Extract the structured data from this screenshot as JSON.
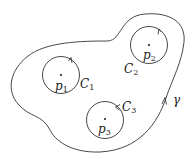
{
  "diagram": {
    "type": "complex-analysis contour diagram",
    "stroke_color": "#333333",
    "outer_contour": {
      "label": "γ",
      "orientation": "counterclockwise"
    },
    "inner_contours": [
      {
        "id": "C1",
        "label_base": "C",
        "label_sub": "1",
        "point_base": "p",
        "point_sub": "1"
      },
      {
        "id": "C2",
        "label_base": "C",
        "label_sub": "2",
        "point_base": "p",
        "point_sub": "2"
      },
      {
        "id": "C3",
        "label_base": "C",
        "label_sub": "3",
        "point_base": "p",
        "point_sub": "3"
      }
    ]
  }
}
